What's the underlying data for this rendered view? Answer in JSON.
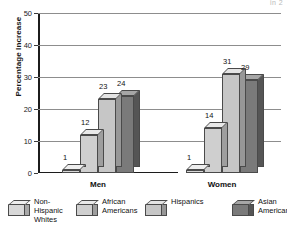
{
  "header_fragment": "in 2",
  "chart_data": {
    "type": "bar",
    "title": "",
    "subtitle": "",
    "xlabel": "",
    "ylabel": "Percentage Increase",
    "ylim": [
      0,
      50
    ],
    "ytick_labels": [
      "0",
      "10",
      "20",
      "30",
      "40",
      "50"
    ],
    "ytick_values": [
      0,
      10,
      20,
      30,
      40,
      50
    ],
    "grid": true,
    "grid_axis": "y",
    "legend_position": "bottom",
    "style": "3d-grouped-bars-grayscale",
    "categories": [
      "Men",
      "Women"
    ],
    "series": [
      {
        "name": "Non-Hispanic Whites",
        "legend_label": "Non-\nHispanic\nWhites",
        "color": "#d8d8d8",
        "top_color": "#eeeeee",
        "side_color": "#a8a8a8",
        "values": [
          1,
          1
        ],
        "value_labels": [
          "1",
          "1"
        ]
      },
      {
        "name": "African Americans",
        "legend_label": "African\nAmericans",
        "color": "#cfcfcf",
        "top_color": "#e9e9e9",
        "side_color": "#9e9e9e",
        "values": [
          12,
          14
        ],
        "value_labels": [
          "12",
          "14"
        ]
      },
      {
        "name": "Hispanics",
        "legend_label": "Hispanics",
        "color": "#c6c6c6",
        "top_color": "#e4e4e4",
        "side_color": "#979797",
        "values": [
          23,
          31
        ],
        "value_labels": [
          "23",
          "31"
        ]
      },
      {
        "name": "Asian Americans",
        "legend_label": "Asian\nAmericans",
        "color": "#7a7a7a",
        "top_color": "#a6a6a6",
        "side_color": "#555555",
        "values": [
          24,
          29
        ],
        "value_labels": [
          "24",
          "29"
        ]
      }
    ]
  },
  "axis": {
    "ylabel": "Percentage Increase"
  },
  "legend": {
    "items": [
      {
        "label": "Non-\nHispanic\nWhites"
      },
      {
        "label": "African\nAmericans"
      },
      {
        "label": "Hispanics"
      },
      {
        "label": "Asian\nAmericans"
      }
    ]
  },
  "groups": [
    {
      "label": "Men"
    },
    {
      "label": "Women"
    }
  ]
}
